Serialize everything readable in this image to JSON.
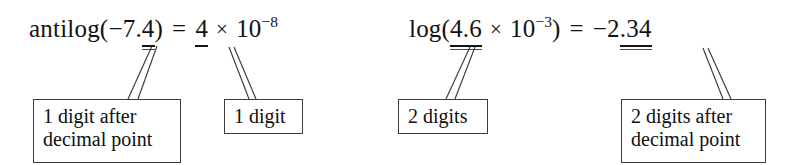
{
  "figure": {
    "kind": "annotated-math-expression-figure",
    "background_color": "#ffffff",
    "text_color": "#121212",
    "rule_color": "#3c3c3c"
  },
  "equations": [
    {
      "id": "antilog",
      "function_name": "antilog",
      "open_paren": "(",
      "argument_sign": "−",
      "argument": "7.",
      "argument_marked": "4",
      "close_paren": ")",
      "equals": "=",
      "coefficient_marked": "4",
      "times": "×",
      "base": "10",
      "exponent": "−8"
    },
    {
      "id": "log",
      "function_name": "log",
      "open_paren": "(",
      "argument_marked": "4.6",
      "times": "×",
      "base": "10",
      "exponent": "−3",
      "close_paren": ")",
      "equals": "=",
      "result_sign": "−",
      "result_integer": "2",
      "result_marked": ".34"
    }
  ],
  "callouts": [
    {
      "id": "callout-1-digit-after-decimal",
      "lines": [
        "1 digit after",
        "decimal point"
      ],
      "points_to": "antilog argument decimal digits"
    },
    {
      "id": "callout-1-digit",
      "lines": [
        "1 digit"
      ],
      "points_to": "antilog result coefficient"
    },
    {
      "id": "callout-2-digits",
      "lines": [
        "2 digits"
      ],
      "points_to": "log argument significant digits"
    },
    {
      "id": "callout-2-digits-after-decimal",
      "lines": [
        "2 digits after",
        "decimal point"
      ],
      "points_to": "log result decimal digits"
    }
  ]
}
